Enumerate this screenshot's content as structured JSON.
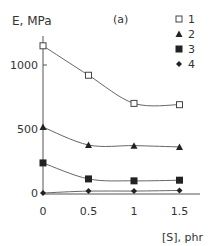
{
  "chart_data": {
    "type": "line",
    "title": "(a)",
    "ylabel": "E, MPa",
    "xlabel": "[S], phr",
    "x": [
      0,
      0.5,
      1,
      1.5
    ],
    "x_tick_labels": [
      "0",
      "0.5",
      "1",
      "1.5"
    ],
    "y_tick_labels": [
      "0",
      "500",
      "1000"
    ],
    "ylim": [
      0,
      1200
    ],
    "xlim": [
      0,
      1.6
    ],
    "grid": false,
    "legend_position": "top-right",
    "series": [
      {
        "name": "1",
        "marker": "open-square",
        "values": [
          1150,
          920,
          700,
          690
        ]
      },
      {
        "name": "2",
        "marker": "filled-triangle",
        "values": [
          515,
          375,
          370,
          360
        ]
      },
      {
        "name": "3",
        "marker": "filled-square",
        "values": [
          235,
          110,
          95,
          100
        ]
      },
      {
        "name": "4",
        "marker": "filled-diamond",
        "values": [
          0,
          15,
          15,
          20
        ]
      }
    ]
  }
}
